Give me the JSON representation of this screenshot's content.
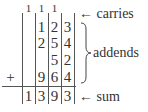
{
  "carries": [
    "1",
    "1",
    "1",
    ""
  ],
  "addends": [
    [
      "",
      "1",
      "2",
      "3"
    ],
    [
      "",
      "2",
      "5",
      "4"
    ],
    [
      "",
      "",
      "5",
      "2"
    ],
    [
      "",
      "9",
      "6",
      "4"
    ]
  ],
  "operator": "+",
  "sum": [
    "1",
    "3",
    "9",
    "3"
  ],
  "labels": {
    "carries": "← carries",
    "addends": "addends",
    "sum": "← sum"
  }
}
